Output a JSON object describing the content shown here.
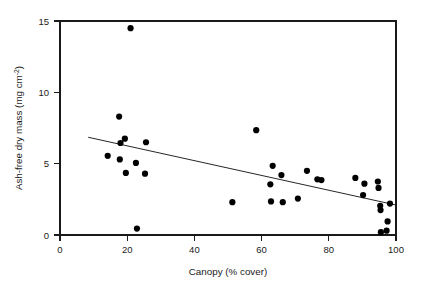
{
  "chart_data": {
    "type": "scatter",
    "title": "",
    "xlabel": "Canopy (% cover)",
    "ylabel": "Ash-free dry mass (mg cm",
    "ylabel_sup": "-2",
    "ylabel_tail": ")",
    "xlim": [
      0,
      100
    ],
    "ylim": [
      0,
      15
    ],
    "xticks": [
      0,
      20,
      40,
      60,
      80,
      100
    ],
    "yticks": [
      0,
      5,
      10,
      15
    ],
    "grid": false,
    "legend": "none",
    "marker_color": "#000000",
    "marker_size": 3.1,
    "points": [
      {
        "x": 14.2,
        "y": 5.55
      },
      {
        "x": 17.6,
        "y": 8.3
      },
      {
        "x": 17.8,
        "y": 5.3
      },
      {
        "x": 18.0,
        "y": 6.45
      },
      {
        "x": 19.3,
        "y": 6.75
      },
      {
        "x": 19.6,
        "y": 4.35
      },
      {
        "x": 21.0,
        "y": 14.5
      },
      {
        "x": 22.6,
        "y": 5.05
      },
      {
        "x": 22.9,
        "y": 0.45
      },
      {
        "x": 25.3,
        "y": 4.3
      },
      {
        "x": 25.6,
        "y": 6.5
      },
      {
        "x": 51.3,
        "y": 2.3
      },
      {
        "x": 58.4,
        "y": 7.35
      },
      {
        "x": 62.6,
        "y": 3.55
      },
      {
        "x": 62.8,
        "y": 2.35
      },
      {
        "x": 63.3,
        "y": 4.85
      },
      {
        "x": 65.9,
        "y": 4.2
      },
      {
        "x": 66.3,
        "y": 2.3
      },
      {
        "x": 70.8,
        "y": 2.55
      },
      {
        "x": 73.5,
        "y": 4.5
      },
      {
        "x": 76.6,
        "y": 3.9
      },
      {
        "x": 77.8,
        "y": 3.85
      },
      {
        "x": 87.9,
        "y": 4.0
      },
      {
        "x": 90.2,
        "y": 2.8
      },
      {
        "x": 90.6,
        "y": 3.6
      },
      {
        "x": 94.6,
        "y": 3.75
      },
      {
        "x": 94.8,
        "y": 3.3
      },
      {
        "x": 95.3,
        "y": 2.05
      },
      {
        "x": 95.4,
        "y": 1.75
      },
      {
        "x": 95.5,
        "y": 0.2
      },
      {
        "x": 97.2,
        "y": 0.3
      },
      {
        "x": 97.5,
        "y": 0.95
      },
      {
        "x": 98.2,
        "y": 2.2
      }
    ],
    "trendline": {
      "x0": 8.4,
      "y0": 6.85,
      "x1": 100.0,
      "y1": 2.1
    }
  }
}
